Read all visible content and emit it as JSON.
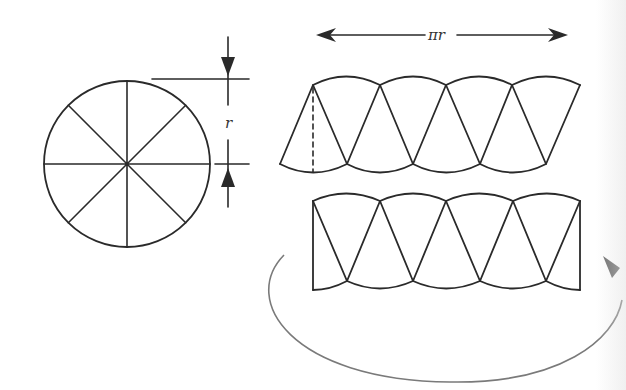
{
  "figure": {
    "colors": {
      "line": "#2a2a2a",
      "arc": "#7a7a7a",
      "background": "#ffffff"
    }
  },
  "circle": {
    "sectors": 8,
    "radius_label": "r"
  },
  "strip_top": {
    "width_label": "πr",
    "sectors": 8,
    "has_dashed_height": true
  },
  "strip_bottom": {
    "sectors": 8,
    "shape": "rectangle-approximation"
  },
  "curved_arrow": {
    "icon": "curved-arrow-icon"
  }
}
